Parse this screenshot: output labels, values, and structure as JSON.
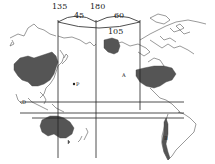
{
  "map": {
    "title": "",
    "longitude_labels": [
      {
        "id": "lon-135",
        "text": "135"
      },
      {
        "id": "lon-180",
        "text": "180"
      }
    ],
    "arc_labels": [
      {
        "id": "arc-45",
        "text": "45"
      },
      {
        "id": "arc-60",
        "text": "60"
      },
      {
        "id": "arc-105",
        "text": "105"
      }
    ],
    "point_labels": [
      {
        "id": "point-a",
        "text": "A"
      },
      {
        "id": "point-b",
        "text": "B"
      },
      {
        "id": "point-d",
        "text": "D"
      },
      {
        "id": "point-p",
        "text": "P"
      }
    ],
    "shaded_regions": [
      "China",
      "Alaska",
      "United States",
      "Australia",
      "Chile"
    ],
    "colors": {
      "land_shade": "#555555",
      "outline": "#444444",
      "background": "#ffffff"
    }
  }
}
